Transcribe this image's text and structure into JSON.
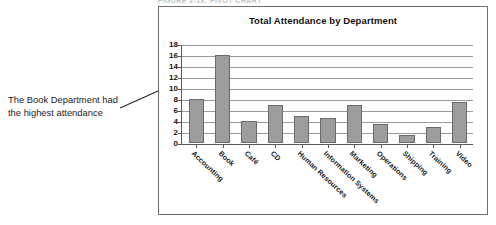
{
  "figure_caption": "FIGURE 2-1x: PIVOT CHART",
  "annotation": {
    "line1": "The Book Department had",
    "line2": "the highest attendance"
  },
  "chart_data": {
    "type": "bar",
    "title": "Total Attendance by Department",
    "xlabel": "",
    "ylabel": "",
    "ylim": [
      0,
      18
    ],
    "yticks": [
      18,
      16,
      14,
      12,
      10,
      8,
      6,
      4,
      2,
      0
    ],
    "grid": true,
    "legend": "none",
    "bar_color": "#9d9d9d",
    "categories": [
      "Accounting",
      "Book",
      "Café",
      "CD",
      "Human Resources",
      "Information Systems",
      "Marketing",
      "Operations",
      "Shipping",
      "Training",
      "Video"
    ],
    "values": [
      8,
      16,
      4,
      7,
      5,
      4.5,
      7,
      3.5,
      1.5,
      3,
      7.5
    ]
  }
}
